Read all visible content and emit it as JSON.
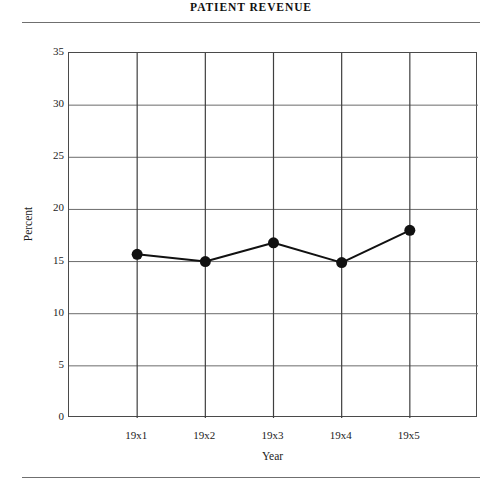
{
  "chart_data": {
    "type": "line",
    "title": "PATIENT REVENUE",
    "xlabel": "Year",
    "ylabel": "Percent",
    "categories": [
      "19x1",
      "19x2",
      "19x3",
      "19x4",
      "19x5"
    ],
    "values": [
      15.7,
      15.0,
      16.8,
      14.9,
      18.0
    ],
    "series": [
      {
        "name": "Percent",
        "values": [
          15.7,
          15.0,
          16.8,
          14.9,
          18.0
        ]
      }
    ],
    "ylim": [
      0,
      35
    ],
    "yticks": [
      0,
      5,
      10,
      15,
      20,
      25,
      30,
      35
    ],
    "ytick_labels": [
      "0",
      "5",
      "10",
      "15",
      "20",
      "25",
      "30",
      "35"
    ],
    "xtick_labels": [
      "19x1",
      "19x2",
      "19x3",
      "19x4",
      "19x5"
    ],
    "grid": true,
    "grid_color": "#6b6b6b",
    "legend": false,
    "legend_position": "none",
    "line_color": "#111111",
    "marker": "circle",
    "marker_color": "#111111",
    "marker_size": 11,
    "frame_color": "#4a4a4a",
    "background": "#ffffff"
  },
  "figure": {
    "title": "PATIENT REVENUE",
    "rule_color": "#6f6f6f"
  }
}
